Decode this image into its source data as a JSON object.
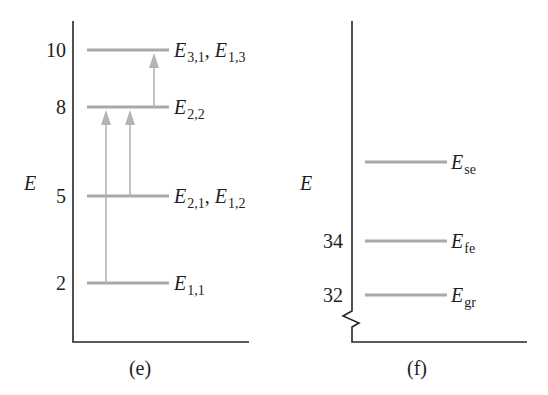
{
  "figure": {
    "type": "energy-level-diagram",
    "colors": {
      "axis": "#262626",
      "level": "#a9a9a9",
      "arrow": "#b4b4b4",
      "background": "#ffffff"
    }
  },
  "panel_e": {
    "caption": "(e)",
    "axis_label": "E",
    "ticks": [
      "10",
      "8",
      "5",
      "2"
    ],
    "levels": [
      {
        "energy": 10,
        "tick": "10",
        "label": [
          {
            "symbol": "E",
            "sub": "3,1"
          },
          {
            "symbol": "E",
            "sub": "1,3"
          }
        ],
        "separator": ", "
      },
      {
        "energy": 8,
        "tick": "8",
        "label": [
          {
            "symbol": "E",
            "sub": "2,2"
          }
        ]
      },
      {
        "energy": 5,
        "tick": "5",
        "label": [
          {
            "symbol": "E",
            "sub": "2,1"
          },
          {
            "symbol": "E",
            "sub": "1,2"
          }
        ],
        "separator": ", "
      },
      {
        "energy": 2,
        "tick": "2",
        "label": [
          {
            "symbol": "E",
            "sub": "1,1"
          }
        ]
      }
    ],
    "transitions": [
      {
        "from": 2,
        "to": 8
      },
      {
        "from": 5,
        "to": 8
      },
      {
        "from": 8,
        "to": 10
      }
    ]
  },
  "panel_f": {
    "caption": "(f)",
    "axis_label": "E",
    "axis_break": true,
    "ticks": [
      "34",
      "32"
    ],
    "levels": [
      {
        "tick": "",
        "label": {
          "symbol": "E",
          "sub": "se"
        }
      },
      {
        "tick": "34",
        "label": {
          "symbol": "E",
          "sub": "fe"
        }
      },
      {
        "tick": "32",
        "label": {
          "symbol": "E",
          "sub": "gr"
        }
      }
    ]
  }
}
